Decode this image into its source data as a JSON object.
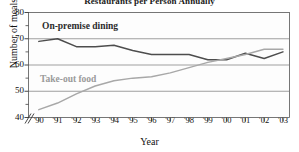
{
  "chart_data": {
    "type": "line",
    "title": "Restaurants per Person Annually",
    "xlabel": "Year",
    "ylabel": "Number of meals",
    "x": [
      "'90",
      "'91",
      "'92",
      "'93",
      "'94",
      "'95",
      "'96",
      "'97",
      "'98",
      "'99",
      "'00",
      "'01",
      "'02",
      "'03"
    ],
    "xtick_labels": [
      "'90",
      "'91",
      "'92",
      "'93",
      "'94",
      "'95",
      "'96",
      "'97",
      "'98",
      "'99",
      "'00",
      "'01",
      "'02",
      "'03"
    ],
    "ytick_labels": [
      "40",
      "50",
      "60",
      "70",
      "80"
    ],
    "ytick_values": [
      40,
      50,
      60,
      70,
      80
    ],
    "ylim": [
      40,
      80
    ],
    "grid": true,
    "grid_axis": "y",
    "axis_break": true,
    "axis_break_symbol": "//",
    "legend": "inline-labels",
    "series": [
      {
        "name": "On-premise dining",
        "color": "#4d4d4d",
        "values": [
          69,
          70,
          67,
          67,
          67.5,
          65.5,
          64,
          64,
          64,
          62,
          62,
          64.5,
          62.5,
          65
        ]
      },
      {
        "name": "Take-out food",
        "color": "#a8a8a8",
        "values": [
          43,
          45.5,
          49,
          52,
          54,
          55,
          55.5,
          57,
          59,
          61,
          62.5,
          64,
          66,
          66
        ]
      }
    ]
  }
}
